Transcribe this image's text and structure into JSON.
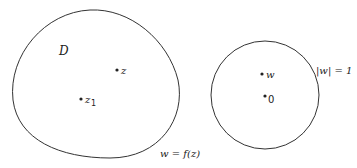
{
  "diagram": {
    "region": {
      "label": "D",
      "mapping_label": "w = f(z)"
    },
    "points_z": [
      {
        "label": "z"
      },
      {
        "label": "z",
        "subscript": "1"
      }
    ],
    "unit_disk": {
      "boundary_label": "|w| = 1"
    },
    "points_w": [
      {
        "label": "w"
      },
      {
        "label": "0"
      }
    ],
    "colors": {
      "stroke": "#333333",
      "text": "#222222",
      "background": "#ffffff"
    }
  }
}
